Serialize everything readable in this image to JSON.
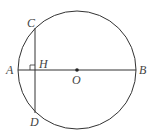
{
  "diagram": {
    "type": "circle-geometry",
    "colors": {
      "stroke": "#333333",
      "label": "#444444",
      "background": "#ffffff"
    },
    "circle": {
      "center_label": "O",
      "cx": 77,
      "cy": 70,
      "r": 59
    },
    "points": {
      "A": {
        "label": "A",
        "x": 18,
        "y": 70
      },
      "B": {
        "label": "B",
        "x": 136,
        "y": 70
      },
      "O": {
        "label": "O",
        "x": 77,
        "y": 70
      },
      "C": {
        "label": "C",
        "x": 35,
        "y": 28
      },
      "D": {
        "label": "D",
        "x": 35,
        "y": 113
      },
      "H": {
        "label": "H",
        "x": 35,
        "y": 70
      }
    },
    "segments": [
      {
        "name": "diameter-AB",
        "from": "A",
        "to": "B"
      },
      {
        "name": "chord-CD",
        "from": "C",
        "to": "D"
      }
    ],
    "annotations": [
      {
        "type": "right-angle",
        "at": "H"
      }
    ]
  }
}
